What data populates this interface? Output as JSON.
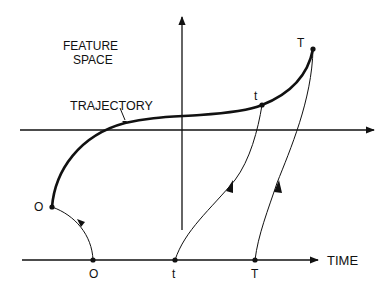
{
  "labels": {
    "feature_space_line1": "FEATURE",
    "feature_space_line2": "SPACE",
    "trajectory": "TRAJECTORY",
    "time_axis": "TIME",
    "point_O_feature": "O",
    "point_t_feature": "t",
    "point_T_feature": "T",
    "point_O_time": "O",
    "point_t_time": "t",
    "point_T_time": "T"
  },
  "colors": {
    "ink": "#111111",
    "background": "#ffffff"
  }
}
